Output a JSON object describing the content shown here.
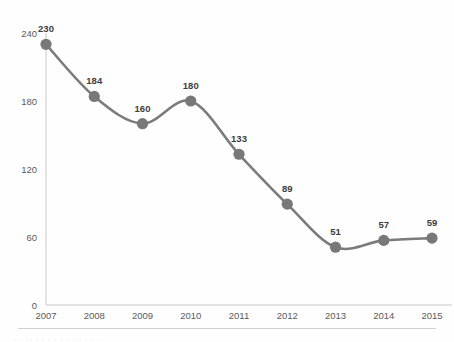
{
  "chart_data": {
    "type": "line",
    "title": "",
    "subtitle": "",
    "xlabel": "",
    "ylabel": "",
    "categories": [
      "2007",
      "2008",
      "2009",
      "2010",
      "2011",
      "2012",
      "2013",
      "2014",
      "2015"
    ],
    "values": [
      230,
      184,
      160,
      180,
      133,
      89,
      51,
      57,
      59
    ],
    "series": [
      {
        "name": "",
        "values": [
          230,
          184,
          160,
          180,
          133,
          89,
          51,
          57,
          59
        ]
      }
    ],
    "data_labels": [
      "230",
      "184",
      "160",
      "180",
      "133",
      "89",
      "51",
      "57",
      "59"
    ],
    "ylim": [
      0,
      240
    ],
    "yticks": [
      0,
      60,
      120,
      180,
      240
    ],
    "ytick_labels": [
      "0",
      "60",
      "120",
      "180",
      "240"
    ],
    "xtick_labels": [
      "2007",
      "2008",
      "2009",
      "2010",
      "2011",
      "2012",
      "2013",
      "2014",
      "2015"
    ],
    "grid": false,
    "legend": false,
    "legend_position": "none",
    "line_style": "smooth",
    "marker": "circle"
  },
  "colors": {
    "line": "#7b7b7b",
    "marker": "#787878",
    "axis": "#c9c9c9",
    "tick_label": "#5a5a5a",
    "data_label": "#3d3d3d",
    "background": "#fefefe",
    "footer_rule": "#cfcfcf"
  },
  "footer": {
    "cut_text": "· · ·· · · · · · · ··· · · ·"
  }
}
